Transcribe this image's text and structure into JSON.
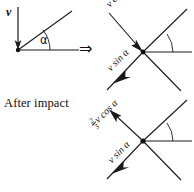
{
  "figure": {
    "caption_text": "After impact",
    "implies_symbol": "⇒",
    "angle_symbol": "α"
  },
  "panels": {
    "before_impact": {
      "name": "before-impact-diagram",
      "incoming_velocity_label": "v",
      "angle_label": "α",
      "description_components": []
    },
    "decomposed": {
      "name": "velocity-decomposition-diagram",
      "normal_component_label": "v cos α",
      "tangential_component_label": "v sin α",
      "angle_label": "α"
    },
    "after_impact": {
      "name": "after-impact-diagram",
      "normal_component_coefficient_numerator": "2",
      "normal_component_coefficient_denominator": "3",
      "normal_component_label": "v cos α",
      "tangential_component_label": "v sin α",
      "angle_label": "α"
    }
  },
  "colors": {
    "ink": "#1a1a1a",
    "background": "#ffffff"
  }
}
